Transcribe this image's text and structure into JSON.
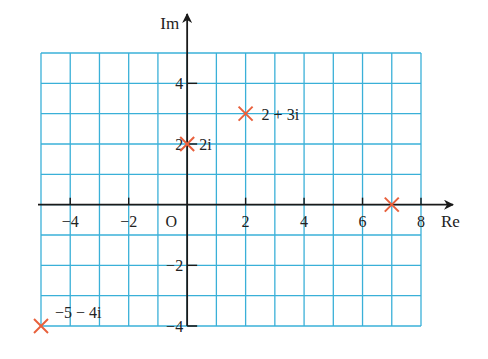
{
  "diagram": {
    "type": "argand-diagram",
    "x_axis_label": "Re",
    "y_axis_label": "Im",
    "origin_label": "O",
    "x_range": [
      -5,
      8
    ],
    "y_range": [
      -4,
      5
    ],
    "x_ticks": [
      {
        "value": -4,
        "label": "−4"
      },
      {
        "value": -2,
        "label": "−2"
      },
      {
        "value": 2,
        "label": "2"
      },
      {
        "value": 4,
        "label": "4"
      },
      {
        "value": 6,
        "label": "6"
      },
      {
        "value": 8,
        "label": "8"
      }
    ],
    "y_ticks": [
      {
        "value": 4,
        "label": "4"
      },
      {
        "value": 2,
        "label": "2"
      },
      {
        "value": -2,
        "label": "−2"
      },
      {
        "value": -4,
        "label": "−4"
      }
    ],
    "points": [
      {
        "re": 2,
        "im": 3,
        "label": "2 + 3i"
      },
      {
        "re": 0,
        "im": 2,
        "label": "2i"
      },
      {
        "re": 7,
        "im": 0,
        "label": ""
      },
      {
        "re": -5,
        "im": -4,
        "label": "−5 − 4i"
      }
    ],
    "colors": {
      "grid": "#3ab0d8",
      "axis": "#1a1a1a",
      "marker": "#e8603c",
      "text": "#222222"
    }
  }
}
